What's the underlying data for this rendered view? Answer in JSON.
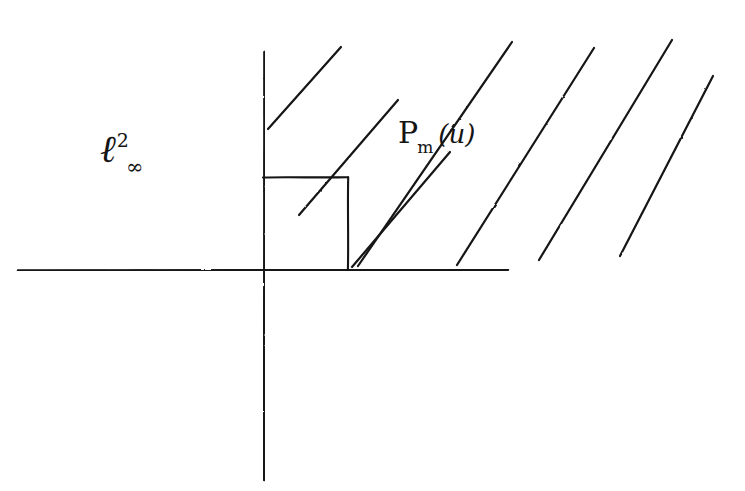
{
  "figure": {
    "kind": "hand-drawn-sketch",
    "medium": "pen on white paper",
    "ink_color": "#141414",
    "paper_color": "#ffffff",
    "width": 745,
    "height": 491,
    "axes": {
      "horizontal": {
        "x_start": 18,
        "x_end": 508,
        "y": 270
      },
      "vertical": {
        "x": 264,
        "y_start": 52,
        "y_end": 480
      },
      "origin": {
        "x": 264,
        "y": 270
      }
    },
    "square": {
      "left": 263,
      "top": 177,
      "right": 348,
      "bottom": 270,
      "filled": false
    },
    "hatching": {
      "angle_degrees": 45,
      "count": 7,
      "lines": [
        {
          "x1": 268,
          "y1": 129,
          "x2": 341,
          "y2": 47
        },
        {
          "x1": 299,
          "y1": 215,
          "x2": 398,
          "y2": 100
        },
        {
          "x1": 352,
          "y1": 267,
          "x2": 450,
          "y2": 152
        },
        {
          "x1": 358,
          "y1": 266,
          "x2": 512,
          "y2": 42
        },
        {
          "x1": 457,
          "y1": 265,
          "x2": 594,
          "y2": 48
        },
        {
          "x1": 539,
          "y1": 260,
          "x2": 672,
          "y2": 40
        },
        {
          "x1": 620,
          "y1": 256,
          "x2": 713,
          "y2": 76
        }
      ]
    },
    "labels": {
      "space": {
        "name": "ell-infinity-squared",
        "base": "ℓ",
        "superscript": "2",
        "subscript": "∞",
        "plain": "ℓ²_∞",
        "x": 100,
        "y": 130
      },
      "operator": {
        "name": "projection-operator",
        "base": "P",
        "subscript": "m",
        "argument": "(u)",
        "plain": "P_m(u)",
        "x": 398,
        "y": 118
      }
    }
  }
}
